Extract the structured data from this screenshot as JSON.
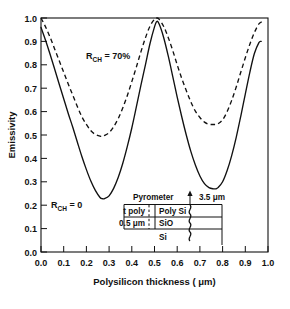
{
  "chart_data": {
    "type": "line",
    "title": "",
    "xlabel": "Polysilicon thickness ( μm)",
    "ylabel": "Emissivity",
    "xlim": [
      0.0,
      1.0
    ],
    "ylim": [
      0.0,
      1.0
    ],
    "xticks": [
      "0.0",
      "0.1",
      "0.2",
      "0.3",
      "0.4",
      "0.5",
      "0.6",
      "0.7",
      "0.8",
      "0.9",
      "1.0"
    ],
    "yticks": [
      "0.0",
      "0.1",
      "0.2",
      "0.3",
      "0.4",
      "0.5",
      "0.6",
      "0.7",
      "0.8",
      "0.9",
      "1.0"
    ],
    "grid": false,
    "legend_position": "inline-annotations",
    "series": [
      {
        "name": "R_CH = 0",
        "style": "solid",
        "color": "#111111",
        "x": [
          0.0,
          0.02,
          0.04,
          0.06,
          0.08,
          0.1,
          0.12,
          0.14,
          0.16,
          0.18,
          0.2,
          0.22,
          0.24,
          0.26,
          0.27,
          0.28,
          0.3,
          0.32,
          0.34,
          0.36,
          0.38,
          0.4,
          0.42,
          0.44,
          0.46,
          0.48,
          0.5,
          0.51,
          0.52,
          0.54,
          0.56,
          0.58,
          0.6,
          0.62,
          0.64,
          0.66,
          0.68,
          0.7,
          0.72,
          0.74,
          0.76,
          0.77,
          0.78,
          0.8,
          0.82,
          0.84,
          0.86,
          0.88,
          0.9,
          0.92,
          0.94,
          0.96,
          0.97
        ],
        "y": [
          0.96,
          0.905,
          0.845,
          0.782,
          0.718,
          0.655,
          0.592,
          0.533,
          0.47,
          0.408,
          0.352,
          0.302,
          0.262,
          0.233,
          0.228,
          0.228,
          0.24,
          0.272,
          0.318,
          0.378,
          0.45,
          0.53,
          0.62,
          0.712,
          0.8,
          0.89,
          0.962,
          0.985,
          0.975,
          0.918,
          0.84,
          0.752,
          0.662,
          0.578,
          0.5,
          0.43,
          0.372,
          0.325,
          0.292,
          0.275,
          0.27,
          0.27,
          0.275,
          0.3,
          0.348,
          0.412,
          0.49,
          0.58,
          0.675,
          0.768,
          0.848,
          0.895,
          0.9
        ]
      },
      {
        "name": "R_CH = 70%",
        "style": "dashed",
        "color": "#111111",
        "x": [
          0.0,
          0.02,
          0.04,
          0.06,
          0.08,
          0.1,
          0.12,
          0.14,
          0.16,
          0.18,
          0.2,
          0.22,
          0.24,
          0.26,
          0.27,
          0.28,
          0.3,
          0.32,
          0.34,
          0.36,
          0.38,
          0.4,
          0.42,
          0.44,
          0.46,
          0.48,
          0.5,
          0.51,
          0.52,
          0.54,
          0.56,
          0.58,
          0.6,
          0.62,
          0.64,
          0.66,
          0.68,
          0.7,
          0.72,
          0.74,
          0.76,
          0.77,
          0.78,
          0.8,
          0.82,
          0.84,
          0.86,
          0.88,
          0.9,
          0.92,
          0.94,
          0.96,
          0.975
        ],
        "y": [
          1.0,
          0.962,
          0.918,
          0.868,
          0.818,
          0.768,
          0.718,
          0.67,
          0.622,
          0.578,
          0.545,
          0.518,
          0.502,
          0.495,
          0.495,
          0.498,
          0.51,
          0.535,
          0.57,
          0.615,
          0.668,
          0.728,
          0.79,
          0.855,
          0.915,
          0.965,
          0.995,
          1.0,
          0.995,
          0.965,
          0.918,
          0.862,
          0.8,
          0.742,
          0.69,
          0.642,
          0.602,
          0.575,
          0.555,
          0.546,
          0.545,
          0.545,
          0.548,
          0.565,
          0.6,
          0.648,
          0.705,
          0.768,
          0.83,
          0.888,
          0.938,
          0.975,
          0.985
        ]
      }
    ],
    "annotations": [
      {
        "name": "series-label-dashed",
        "text": "R",
        "subscript": "CH",
        "suffix": " = 70%",
        "x": 0.22,
        "y": 0.835
      },
      {
        "name": "series-label-solid",
        "text": "R",
        "subscript": "CH",
        "suffix": " = 0",
        "x": 0.075,
        "y": 0.2
      }
    ]
  },
  "inset": {
    "name": "pyrometer-stack-diagram",
    "pyrometer_label": "Pyrometer",
    "wavelength_label": "3.5 μm",
    "left_labels": [
      {
        "name": "t-poly-label",
        "text": "t poly"
      },
      {
        "name": "oxide-thickness-label",
        "text": "0.5 μm"
      }
    ],
    "layers": [
      {
        "name": "poly-si-layer",
        "text": "Poly Si"
      },
      {
        "name": "sio2-layer",
        "text": "SiO",
        "subscript": "2"
      },
      {
        "name": "si-substrate-layer",
        "text": "Si"
      }
    ]
  },
  "colors": {
    "ink": "#111111",
    "background": "#ffffff"
  }
}
